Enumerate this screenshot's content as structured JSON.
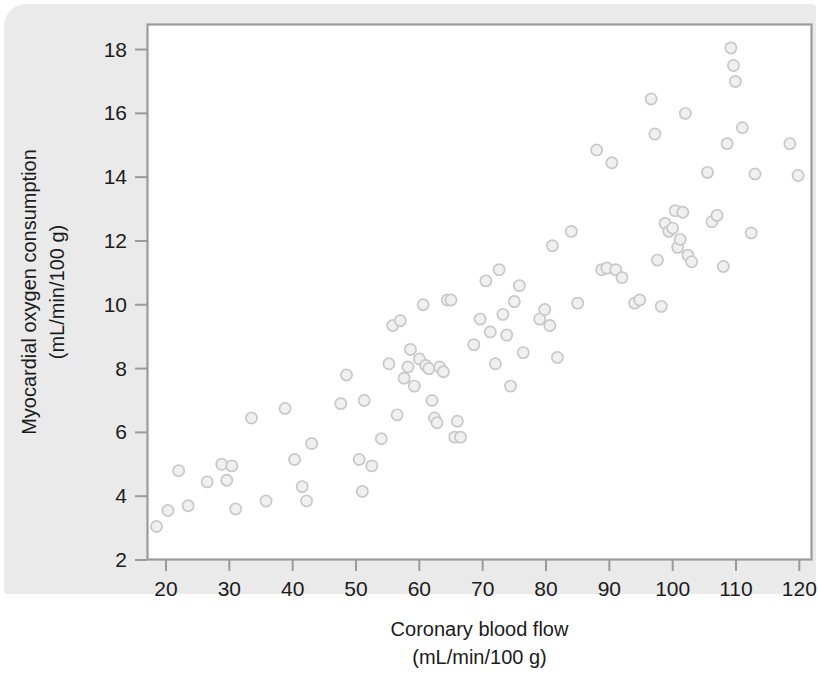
{
  "figure": {
    "background_color": "#ffffff",
    "panel_color": "#eaeaea",
    "plot_background": "#ffffff",
    "frame_color": "#9a9a9a",
    "marker_stroke": "#c8c8c8",
    "marker_fill": "#f0f0f0",
    "text_color": "#1b1b1b"
  },
  "chart_data": {
    "type": "scatter",
    "title": "",
    "xlabel": "Coronary blood flow",
    "xlabel_units": "(mL/min/100 g)",
    "ylabel": "Myocardial oxygen consumption",
    "ylabel_units": "(mL/min/100 g)",
    "xlim": [
      17,
      122
    ],
    "ylim": [
      2,
      18.8
    ],
    "xticks": [
      20,
      30,
      40,
      50,
      60,
      70,
      80,
      90,
      100,
      110,
      120
    ],
    "xticklabels": [
      "20",
      "30",
      "40",
      "50",
      "60",
      "70",
      "80",
      "90",
      "100",
      "110",
      "120"
    ],
    "yticks": [
      2,
      4,
      6,
      8,
      10,
      12,
      14,
      16,
      18
    ],
    "yticklabels": [
      "2",
      "4",
      "6",
      "8",
      "10",
      "12",
      "14",
      "16",
      "18"
    ],
    "grid": false,
    "legend": null,
    "marker": "open-circle",
    "n_points": 98,
    "points": [
      [
        18.5,
        3.05
      ],
      [
        20.3,
        3.55
      ],
      [
        22.0,
        4.8
      ],
      [
        23.5,
        3.7
      ],
      [
        26.5,
        4.45
      ],
      [
        28.8,
        5.0
      ],
      [
        29.6,
        4.5
      ],
      [
        30.4,
        4.95
      ],
      [
        31.0,
        3.6
      ],
      [
        33.5,
        6.45
      ],
      [
        35.8,
        3.85
      ],
      [
        38.8,
        6.75
      ],
      [
        40.3,
        5.15
      ],
      [
        41.5,
        4.3
      ],
      [
        42.2,
        3.85
      ],
      [
        43.0,
        5.65
      ],
      [
        47.6,
        6.9
      ],
      [
        48.5,
        7.8
      ],
      [
        50.5,
        5.15
      ],
      [
        51.0,
        4.15
      ],
      [
        51.3,
        7.0
      ],
      [
        52.5,
        4.95
      ],
      [
        54.0,
        5.8
      ],
      [
        55.2,
        8.15
      ],
      [
        55.8,
        9.35
      ],
      [
        56.5,
        6.55
      ],
      [
        57.0,
        9.5
      ],
      [
        57.6,
        7.7
      ],
      [
        58.2,
        8.05
      ],
      [
        58.6,
        8.6
      ],
      [
        59.2,
        7.45
      ],
      [
        60.0,
        8.3
      ],
      [
        60.6,
        10.0
      ],
      [
        61.0,
        8.1
      ],
      [
        61.5,
        8.0
      ],
      [
        62.0,
        7.0
      ],
      [
        62.4,
        6.45
      ],
      [
        62.8,
        6.3
      ],
      [
        63.2,
        8.05
      ],
      [
        63.8,
        7.9
      ],
      [
        64.4,
        10.15
      ],
      [
        65.0,
        10.15
      ],
      [
        65.6,
        5.85
      ],
      [
        66.0,
        6.35
      ],
      [
        66.5,
        5.85
      ],
      [
        68.6,
        8.75
      ],
      [
        69.6,
        9.55
      ],
      [
        70.5,
        10.75
      ],
      [
        71.2,
        9.15
      ],
      [
        72.0,
        8.15
      ],
      [
        72.6,
        11.1
      ],
      [
        73.2,
        9.7
      ],
      [
        73.8,
        9.05
      ],
      [
        74.4,
        7.45
      ],
      [
        75.0,
        10.1
      ],
      [
        75.8,
        10.6
      ],
      [
        76.4,
        8.5
      ],
      [
        79.0,
        9.55
      ],
      [
        79.8,
        9.85
      ],
      [
        80.6,
        9.35
      ],
      [
        81.0,
        11.85
      ],
      [
        81.8,
        8.35
      ],
      [
        84.0,
        12.3
      ],
      [
        85.0,
        10.05
      ],
      [
        88.0,
        14.85
      ],
      [
        88.8,
        11.1
      ],
      [
        89.6,
        11.15
      ],
      [
        90.4,
        14.45
      ],
      [
        91.0,
        11.1
      ],
      [
        92.0,
        10.85
      ],
      [
        94.0,
        10.05
      ],
      [
        94.8,
        10.15
      ],
      [
        96.6,
        16.45
      ],
      [
        97.2,
        15.35
      ],
      [
        97.6,
        11.4
      ],
      [
        98.2,
        9.95
      ],
      [
        98.8,
        12.55
      ],
      [
        99.4,
        12.3
      ],
      [
        100.0,
        12.4
      ],
      [
        100.4,
        12.95
      ],
      [
        100.8,
        11.8
      ],
      [
        101.2,
        12.05
      ],
      [
        101.6,
        12.9
      ],
      [
        102.0,
        16.0
      ],
      [
        102.4,
        11.55
      ],
      [
        103.0,
        11.35
      ],
      [
        105.5,
        14.15
      ],
      [
        106.2,
        12.6
      ],
      [
        107.0,
        12.8
      ],
      [
        108.0,
        11.2
      ],
      [
        108.6,
        15.05
      ],
      [
        109.2,
        18.05
      ],
      [
        109.6,
        17.5
      ],
      [
        109.9,
        17.0
      ],
      [
        111.0,
        15.55
      ],
      [
        112.4,
        12.25
      ],
      [
        113.0,
        14.1
      ],
      [
        118.5,
        15.05
      ],
      [
        119.8,
        14.05
      ]
    ]
  }
}
